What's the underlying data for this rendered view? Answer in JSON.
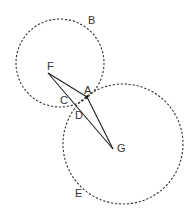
{
  "diagram": {
    "circles": [
      {
        "name": "B",
        "label": "B",
        "cx": 60,
        "cy": 63,
        "r": 44,
        "label_x": 88,
        "label_y": 24
      },
      {
        "name": "E",
        "label": "E",
        "cx": 123,
        "cy": 144,
        "r": 60,
        "label_x": 75,
        "label_y": 197
      }
    ],
    "points": [
      {
        "name": "F",
        "label": "F",
        "x": 48,
        "y": 73,
        "label_x": 47,
        "label_y": 70
      },
      {
        "name": "A",
        "label": "A",
        "x": 87,
        "y": 97,
        "label_x": 84,
        "label_y": 94
      },
      {
        "name": "C",
        "label": "C",
        "x": 66,
        "y": 103,
        "label_x": 60,
        "label_y": 104
      },
      {
        "name": "D",
        "label": "D",
        "x": 76,
        "y": 108,
        "label_x": 75,
        "label_y": 119
      },
      {
        "name": "G",
        "label": "G",
        "x": 113,
        "y": 149,
        "label_x": 117,
        "label_y": 152
      }
    ],
    "segments": [
      {
        "from": "F",
        "to": "A"
      },
      {
        "from": "A",
        "to": "G"
      },
      {
        "from": "F",
        "to": "G"
      }
    ]
  }
}
